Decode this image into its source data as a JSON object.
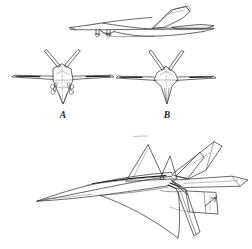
{
  "document": {
    "kind": "technical-line-drawing",
    "subject": "aircraft three-view concept illustration",
    "background_color": "#ffffff",
    "ink_color": "#2a2a2a",
    "width_px": 252,
    "height_px": 249
  },
  "figures": [
    {
      "id": "side-profile",
      "name": "side-profile-view",
      "description": "Side elevation of delta-wing aircraft with canted twin tail fins and landing gear",
      "label": ""
    },
    {
      "id": "front-view-a",
      "name": "front-view-a",
      "description": "Front elevation showing faceted fuselage, canted twin tails and deployed landing gear",
      "label": "A"
    },
    {
      "id": "front-view-b",
      "name": "front-view-b",
      "description": "Front elevation showing faceted fuselage with ventral keel and canted twin tails",
      "label": "B"
    },
    {
      "id": "perspective-view",
      "name": "three-quarter-perspective-view",
      "description": "Three-quarter perspective of the aircraft from below and ahead",
      "label": ""
    }
  ],
  "annotations": {
    "label_a": "A",
    "label_b": "B",
    "leader_arrow": "arrow-pointing-to-tail-surface"
  }
}
